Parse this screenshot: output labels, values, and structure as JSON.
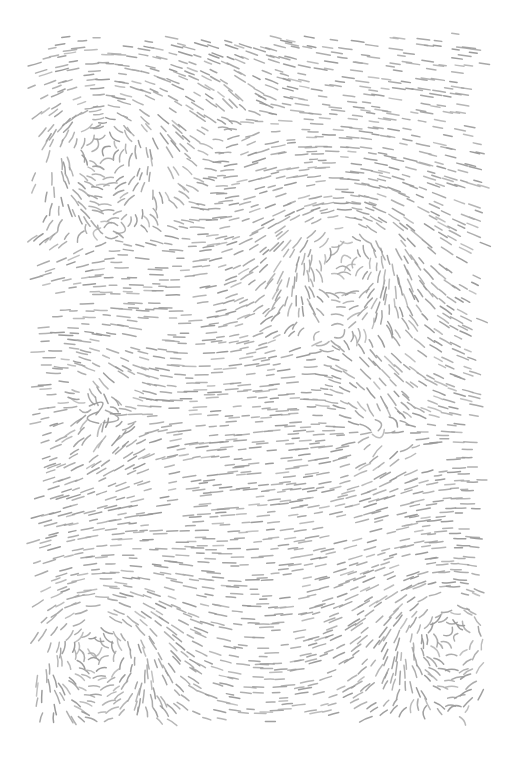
{
  "artwork": {
    "title": "Flow Field Dash Pattern",
    "type": "generative-vector-field",
    "canvas": {
      "width": 506,
      "height": 761,
      "background_color": "#ffffff"
    },
    "plot_area": {
      "left": 31,
      "top": 31,
      "right": 487,
      "bottom": 726,
      "width": 456,
      "height": 695
    },
    "stroke": {
      "color": "#9a9a9a",
      "secondary_color": "#ababab",
      "width": 1.5,
      "linecap": "round",
      "dash_length_min": 7,
      "dash_length_max": 14,
      "dash_curvature": 0.22
    },
    "sampling": {
      "grid_spacing": 8.2,
      "jitter": 3.0,
      "keep_probability": 0.62,
      "seed": 20240517
    },
    "field": {
      "model": "superposed-vortices",
      "base_angle_degrees": 0,
      "singularities": [
        {
          "name": "vortex-top-left",
          "x": 103,
          "y": 148,
          "strength": 1.0,
          "spin": "counter-clockwise"
        },
        {
          "name": "vortex-upper-right",
          "x": 345,
          "y": 258,
          "strength": 0.92,
          "spin": "counter-clockwise"
        },
        {
          "name": "vortex-lower-left",
          "x": 95,
          "y": 650,
          "strength": 0.96,
          "spin": "counter-clockwise"
        },
        {
          "name": "vortex-lower-right",
          "x": 452,
          "y": 635,
          "strength": 0.9,
          "spin": "counter-clockwise"
        }
      ],
      "saddles": [
        {
          "name": "saddle-mid-left",
          "x": 120,
          "y": 415,
          "strength": 0.4
        },
        {
          "name": "saddle-mid-right",
          "x": 400,
          "y": 430,
          "strength": 0.36
        },
        {
          "name": "saddle-upper-mid",
          "x": 250,
          "y": 120,
          "strength": 0.3
        }
      ]
    }
  },
  "chart_data": {
    "type": "scatter",
    "xlabel": "",
    "ylabel": "",
    "xlim": [
      31,
      487
    ],
    "ylim": [
      31,
      726
    ],
    "grid": false,
    "legend": "none",
    "series": [
      {
        "name": "dash-strokes",
        "description": "Short curved dashes oriented tangent to a superposition of four counter-clockwise vortex fields",
        "marker": "curved-dash",
        "color": "#9a9a9a",
        "approximate_count": 4200
      }
    ],
    "annotations": [
      {
        "label": "vortex-top-left",
        "x": 103,
        "y": 148
      },
      {
        "label": "vortex-upper-right",
        "x": 345,
        "y": 258
      },
      {
        "label": "vortex-lower-left",
        "x": 95,
        "y": 650
      },
      {
        "label": "vortex-lower-right",
        "x": 452,
        "y": 635
      }
    ]
  }
}
